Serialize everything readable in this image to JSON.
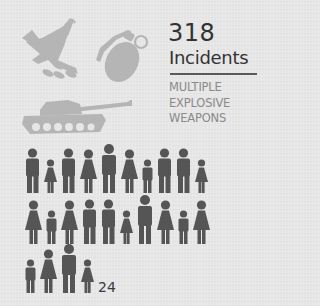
{
  "infographic": {
    "stat": {
      "number": "318",
      "label": "Incidents"
    },
    "category": {
      "lines": [
        "MULTIPLE",
        "EXPLOSIVE",
        "WEAPONS"
      ]
    },
    "weapon_icons": [
      "fighter-jet-icon",
      "grenade-icon",
      "tank-icon"
    ],
    "casualties": {
      "count": "24",
      "rows": [
        [
          "man",
          "girl",
          "man",
          "woman",
          "man-tall",
          "woman",
          "boy",
          "man",
          "man",
          "girl"
        ],
        [
          "woman",
          "boy",
          "woman",
          "man",
          "man",
          "girl",
          "man-tall",
          "woman",
          "boy",
          "woman"
        ],
        [
          "boy",
          "woman",
          "man-tall",
          "girl"
        ]
      ]
    },
    "colors": {
      "background": "#e6e6e6",
      "weapon_icon": "#b5b5b5",
      "person_icon": "#555555",
      "headline_text": "#333333",
      "category_text": "#8a8a8a",
      "divider": "#5a5a5a"
    }
  }
}
